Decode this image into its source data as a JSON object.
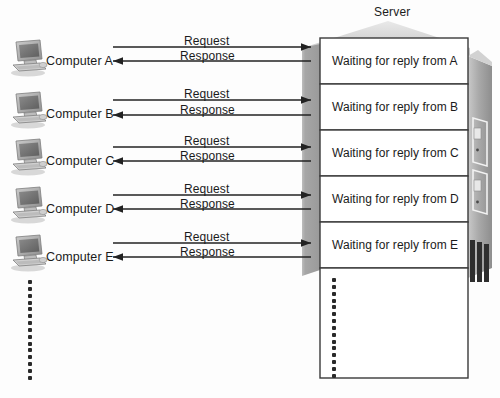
{
  "figure": {
    "title": "Server",
    "background_color": "#fdfdfd",
    "ink_color": "#1b1b1b"
  },
  "server": {
    "label": "Server",
    "tower_body_color": "#a8a8a8",
    "tower_face_color": "#9b9b9b",
    "tower_highlight_color": "#cfcfcf",
    "queue_box_fill": "#ffffff",
    "queue_box_stroke": "#3a3a3a",
    "slots": [
      {
        "label": "Waiting for reply from A"
      },
      {
        "label": "Waiting for reply from B"
      },
      {
        "label": "Waiting for reply from C"
      },
      {
        "label": "Waiting for reply from D"
      },
      {
        "label": "Waiting for reply from E"
      }
    ],
    "continuation_dots_count": 15
  },
  "clients": [
    {
      "label": "Computer A",
      "icon": "desktop-computer-icon",
      "request_label": "Request",
      "response_label": "Response"
    },
    {
      "label": "Computer B",
      "icon": "desktop-computer-icon",
      "request_label": "Request",
      "response_label": "Response"
    },
    {
      "label": "Computer C",
      "icon": "desktop-computer-icon",
      "request_label": "Request",
      "response_label": "Response"
    },
    {
      "label": "Computer D",
      "icon": "desktop-computer-icon",
      "request_label": "Request",
      "response_label": "Response"
    },
    {
      "label": "Computer E",
      "icon": "desktop-computer-icon",
      "request_label": "Request",
      "response_label": "Response"
    }
  ],
  "client_continuation_dots_count": 15
}
